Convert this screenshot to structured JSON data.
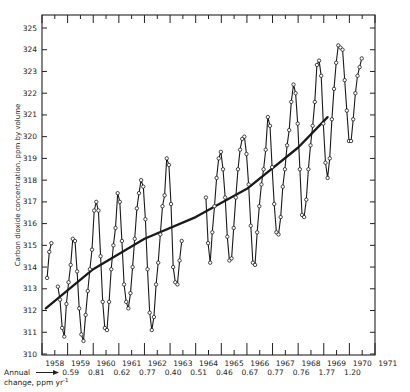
{
  "chart_data": {
    "type": "line",
    "title": "",
    "xlabel": "",
    "ylabel": "Carbon dioxide concentration, ppm by volume",
    "ylim": [
      310,
      325
    ],
    "xlim": [
      1958,
      1971
    ],
    "grid": false,
    "legend": null,
    "y_ticks": [
      310,
      311,
      312,
      313,
      314,
      315,
      316,
      317,
      318,
      319,
      320,
      321,
      322,
      323,
      324,
      325
    ],
    "x_tick_labels": [
      "1958",
      "1959",
      "1960",
      "1961",
      "1962",
      "1963",
      "1964",
      "1965",
      "1966",
      "1967",
      "1968",
      "1969",
      "1970",
      "1971"
    ],
    "series": [
      {
        "name": "Monthly mean CO2 (Mauna Loa)",
        "style": "line-with-open-circles",
        "segments": [
          {
            "start": 1958.2,
            "values": [
              313.5,
              314.7,
              315.1
            ]
          },
          {
            "start": 1958.62,
            "values": [
              313.1,
              312.5,
              311.2,
              310.8,
              312.3,
              313.3,
              314.1,
              315.3,
              315.2,
              313.8,
              312.1,
              310.9,
              310.6,
              311.8,
              312.9,
              313.9,
              314.8,
              316.6,
              317.0,
              316.6,
              314.5,
              312.4,
              311.2,
              311.1,
              312.4,
              313.9,
              315.0,
              315.8,
              317.4,
              317.0,
              315.2,
              313.2,
              312.4,
              312.1,
              312.8,
              314.0,
              315.3,
              316.7,
              317.4,
              318.0,
              317.7,
              316.2,
              313.9,
              311.9,
              311.1,
              311.7,
              313.2,
              314.2,
              315.5,
              316.8,
              317.3,
              319.0,
              318.7,
              316.9,
              314.0,
              313.3,
              313.2,
              314.3,
              315.2
            ]
          },
          {
            "start": 1964.4,
            "values": [
              317.2,
              315.1,
              314.2,
              315.6,
              316.8,
              318.1,
              319.0,
              319.3,
              318.5,
              317.2,
              315.4,
              314.3,
              314.4,
              315.8,
              317.2,
              318.5,
              319.4,
              319.9,
              320.0,
              319.2,
              317.8,
              315.9,
              314.2,
              314.1,
              315.6,
              316.8,
              317.8,
              318.5,
              319.4,
              320.9,
              320.5,
              318.6,
              316.9,
              315.6,
              315.5,
              316.3,
              317.7,
              318.5,
              319.6,
              320.3,
              321.6,
              322.4,
              322.0,
              320.6,
              318.5,
              316.4,
              316.3,
              317.1,
              318.5,
              319.6,
              320.5,
              321.6,
              323.3,
              323.5,
              322.8,
              320.6,
              318.8,
              318.1,
              319.0,
              320.8,
              322.2,
              323.4,
              324.2,
              324.1,
              324.0,
              322.6,
              321.2,
              319.8,
              319.8,
              320.8,
              322.0,
              322.8,
              323.2,
              323.6
            ]
          }
        ]
      },
      {
        "name": "Trend",
        "style": "thick-smooth-line",
        "x": [
          1958.15,
          1960.0,
          1962.0,
          1964.0,
          1966.0,
          1968.0,
          1969.15
        ],
        "values": [
          312.1,
          313.9,
          315.3,
          316.3,
          317.6,
          319.5,
          320.9
        ]
      }
    ],
    "annotations": {
      "annual_change_label": "Annual",
      "annual_change_label2": "change, ppm yr",
      "annual_change_unit_sup": "-1",
      "annual_change_values": [
        "0.59",
        "0.81",
        "0.62",
        "0.77",
        "0.40",
        "0.51",
        "0.46",
        "0.67",
        "0.77",
        "0.76",
        "1.77",
        "1.20"
      ]
    }
  },
  "labels": {
    "ylabel": "Carbon dioxide concentration, ppm by volume",
    "annual": "Annual",
    "change": "change, ppm yr",
    "sup": "-1"
  }
}
